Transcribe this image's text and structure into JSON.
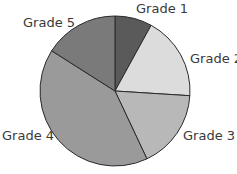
{
  "chart_data": {
    "type": "pie",
    "title": "",
    "categories": [
      "Grade 1",
      "Grade 2",
      "Grade 3",
      "Grade 4",
      "Grade 5"
    ],
    "values": [
      8,
      18,
      17,
      41,
      16
    ],
    "unit": "percent (estimated from slice angles)",
    "colors": [
      "#5a5a5a",
      "#dcdcdc",
      "#b8b8b8",
      "#9a9a9a",
      "#7a7a7a"
    ],
    "start_angle_deg": 0,
    "direction": "clockwise",
    "legend": "none (direct slice labels)"
  },
  "labels": {
    "g1": "Grade 1",
    "g2": "Grade 2",
    "g3": "Grade 3",
    "g4": "Grade 4",
    "g5": "Grade 5"
  }
}
